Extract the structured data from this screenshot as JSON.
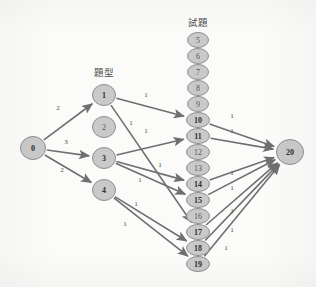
{
  "diagram": {
    "type": "directed-graph",
    "layer_labels": [
      {
        "id": "question-type",
        "text": "題型",
        "x": 104,
        "y": 76
      },
      {
        "id": "question-bank",
        "text": "試題",
        "x": 198,
        "y": 26
      }
    ],
    "nodes": [
      {
        "id": "0",
        "label": "0",
        "cx": 33,
        "cy": 148,
        "rx": 12.5,
        "ry": 11.5,
        "bold": true
      },
      {
        "id": "1",
        "label": "1",
        "cx": 104,
        "cy": 95,
        "rx": 11.5,
        "ry": 10.5,
        "bold": true
      },
      {
        "id": "2",
        "label": "2",
        "cx": 104,
        "cy": 127,
        "rx": 11.5,
        "ry": 10.5,
        "bold": false
      },
      {
        "id": "3",
        "label": "3",
        "cx": 104,
        "cy": 158,
        "rx": 11.5,
        "ry": 10.5,
        "bold": true
      },
      {
        "id": "4",
        "label": "4",
        "cx": 104,
        "cy": 190,
        "rx": 11.5,
        "ry": 10.5,
        "bold": true
      },
      {
        "id": "5",
        "label": "5",
        "cx": 198,
        "cy": 40,
        "rx": 10.5,
        "ry": 7.5,
        "bold": false
      },
      {
        "id": "6",
        "label": "6",
        "cx": 198,
        "cy": 56,
        "rx": 10.5,
        "ry": 7.5,
        "bold": false
      },
      {
        "id": "7",
        "label": "7",
        "cx": 198,
        "cy": 72,
        "rx": 10.5,
        "ry": 7.5,
        "bold": false
      },
      {
        "id": "8",
        "label": "8",
        "cx": 198,
        "cy": 88,
        "rx": 10.5,
        "ry": 7.5,
        "bold": false
      },
      {
        "id": "9",
        "label": "9",
        "cx": 198,
        "cy": 104,
        "rx": 10.5,
        "ry": 7.5,
        "bold": false
      },
      {
        "id": "10",
        "label": "10",
        "cx": 198,
        "cy": 120,
        "rx": 11.5,
        "ry": 7.5,
        "bold": true
      },
      {
        "id": "11",
        "label": "11",
        "cx": 198,
        "cy": 136,
        "rx": 11.5,
        "ry": 7.5,
        "bold": true
      },
      {
        "id": "12",
        "label": "12",
        "cx": 198,
        "cy": 152,
        "rx": 11.5,
        "ry": 7.5,
        "bold": false
      },
      {
        "id": "13",
        "label": "13",
        "cx": 198,
        "cy": 168,
        "rx": 11.5,
        "ry": 7.5,
        "bold": false
      },
      {
        "id": "14",
        "label": "14",
        "cx": 198,
        "cy": 184,
        "rx": 11.5,
        "ry": 7.5,
        "bold": true
      },
      {
        "id": "15",
        "label": "15",
        "cx": 198,
        "cy": 200,
        "rx": 11.5,
        "ry": 7.5,
        "bold": true
      },
      {
        "id": "16",
        "label": "16",
        "cx": 198,
        "cy": 216,
        "rx": 11.5,
        "ry": 7.5,
        "bold": false
      },
      {
        "id": "17",
        "label": "17",
        "cx": 198,
        "cy": 232,
        "rx": 11.5,
        "ry": 7.5,
        "bold": true
      },
      {
        "id": "18",
        "label": "18",
        "cx": 198,
        "cy": 248,
        "rx": 11.5,
        "ry": 7.5,
        "bold": true
      },
      {
        "id": "19",
        "label": "19",
        "cx": 198,
        "cy": 264,
        "rx": 11.5,
        "ry": 7.5,
        "bold": true
      },
      {
        "id": "20",
        "label": "20",
        "cx": 290,
        "cy": 152,
        "rx": 13.5,
        "ry": 12.5,
        "bold": true
      }
    ],
    "edges": [
      {
        "from": "0",
        "to": "1",
        "weight": "2",
        "wx": 58,
        "wy": 110
      },
      {
        "from": "0",
        "to": "3",
        "weight": "3",
        "wx": 66,
        "wy": 144
      },
      {
        "from": "0",
        "to": "4",
        "weight": "2",
        "wx": 62,
        "wy": 172
      },
      {
        "from": "1",
        "to": "10",
        "weight": "1",
        "wx": 146,
        "wy": 97
      },
      {
        "from": "1",
        "to": "17",
        "weight": "1",
        "wx": 131,
        "wy": 125
      },
      {
        "from": "3",
        "to": "11",
        "weight": "1",
        "wx": 146,
        "wy": 133
      },
      {
        "from": "3",
        "to": "14",
        "weight": "1",
        "wx": 160,
        "wy": 167
      },
      {
        "from": "3",
        "to": "15",
        "weight": "1",
        "wx": 140,
        "wy": 182
      },
      {
        "from": "4",
        "to": "18",
        "weight": "1",
        "wx": 136,
        "wy": 206
      },
      {
        "from": "4",
        "to": "19",
        "weight": "1",
        "wx": 125,
        "wy": 226
      },
      {
        "from": "10",
        "to": "20",
        "weight": "1",
        "wx": 232,
        "wy": 118
      },
      {
        "from": "11",
        "to": "20",
        "weight": "1",
        "wx": 232,
        "wy": 133
      },
      {
        "from": "14",
        "to": "20",
        "weight": "1",
        "wx": 232,
        "wy": 175
      },
      {
        "from": "15",
        "to": "20",
        "weight": "1",
        "wx": 232,
        "wy": 190
      },
      {
        "from": "17",
        "to": "20",
        "weight": "1",
        "wx": 232,
        "wy": 213
      },
      {
        "from": "18",
        "to": "20",
        "weight": "1",
        "wx": 232,
        "wy": 232
      },
      {
        "from": "19",
        "to": "20",
        "weight": "1",
        "wx": 226,
        "wy": 250
      }
    ],
    "colors": {
      "node_fill": "#c9c9c9",
      "node_stroke": "#8e8e8e",
      "edge": "#6f6f6f",
      "text": "#2f2f2f",
      "background": "#fbfbfa"
    }
  }
}
